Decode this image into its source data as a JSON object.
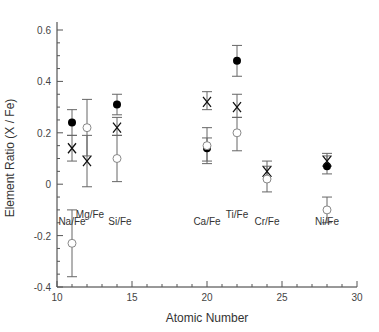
{
  "chart_data": {
    "type": "scatter",
    "title": "",
    "xlabel": "Atomic Number",
    "ylabel": "Element Ratio (X / Fe)",
    "xlim": [
      10,
      30
    ],
    "ylim": [
      -0.4,
      0.6
    ],
    "xticks": [
      10,
      15,
      20,
      25,
      30
    ],
    "yticks": [
      -0.4,
      -0.2,
      0,
      0.2,
      0.4,
      0.6
    ],
    "ytick_labels": [
      "-0.4",
      "-0.2",
      "0",
      "0.2",
      "0.4",
      "0.6"
    ],
    "grid": false,
    "annotations": [
      {
        "text": "Na/Fe",
        "x": 11,
        "y": -0.16
      },
      {
        "text": "Mg/Fe",
        "x": 12.2,
        "y": -0.13
      },
      {
        "text": "Si/Fe",
        "x": 14.2,
        "y": -0.16
      },
      {
        "text": "Ca/Fe",
        "x": 20,
        "y": -0.16
      },
      {
        "text": "Ti/Fe",
        "x": 22,
        "y": -0.13
      },
      {
        "text": "Cr/Fe",
        "x": 24,
        "y": -0.16
      },
      {
        "text": "Ni/Fe",
        "x": 28,
        "y": -0.16
      }
    ],
    "series": [
      {
        "name": "filled-circle",
        "marker": "filled_circle",
        "points": [
          {
            "x": 11,
            "y": 0.24,
            "lo": 0.19,
            "hi": 0.29
          },
          {
            "x": 14,
            "y": 0.31,
            "lo": 0.27,
            "hi": 0.35
          },
          {
            "x": 20,
            "y": 0.14,
            "lo": 0.08,
            "hi": 0.18
          },
          {
            "x": 22,
            "y": 0.48,
            "lo": 0.42,
            "hi": 0.54
          },
          {
            "x": 28,
            "y": 0.07,
            "lo": 0.04,
            "hi": 0.12
          }
        ]
      },
      {
        "name": "cross",
        "marker": "x",
        "points": [
          {
            "x": 11,
            "y": 0.14,
            "lo": 0.09,
            "hi": 0.19
          },
          {
            "x": 12,
            "y": 0.09,
            "lo": -0.01,
            "hi": 0.19
          },
          {
            "x": 14,
            "y": 0.22,
            "lo": 0.19,
            "hi": 0.26
          },
          {
            "x": 20,
            "y": 0.32,
            "lo": 0.29,
            "hi": 0.36
          },
          {
            "x": 22,
            "y": 0.3,
            "lo": 0.26,
            "hi": 0.35
          },
          {
            "x": 24,
            "y": 0.05,
            "lo": 0.03,
            "hi": 0.09
          },
          {
            "x": 28,
            "y": 0.09,
            "lo": 0.07,
            "hi": 0.11
          }
        ]
      },
      {
        "name": "open-circle",
        "marker": "open_circle",
        "points": [
          {
            "x": 11,
            "y": -0.23,
            "lo": -0.36,
            "hi": -0.1
          },
          {
            "x": 12,
            "y": 0.22,
            "lo": 0.11,
            "hi": 0.33
          },
          {
            "x": 14,
            "y": 0.1,
            "lo": 0.01,
            "hi": 0.19
          },
          {
            "x": 20,
            "y": 0.15,
            "lo": 0.09,
            "hi": 0.22
          },
          {
            "x": 22,
            "y": 0.2,
            "lo": 0.13,
            "hi": 0.26
          },
          {
            "x": 24,
            "y": 0.02,
            "lo": -0.03,
            "hi": 0.07
          },
          {
            "x": 28,
            "y": -0.1,
            "lo": -0.15,
            "hi": -0.05
          }
        ]
      }
    ]
  }
}
